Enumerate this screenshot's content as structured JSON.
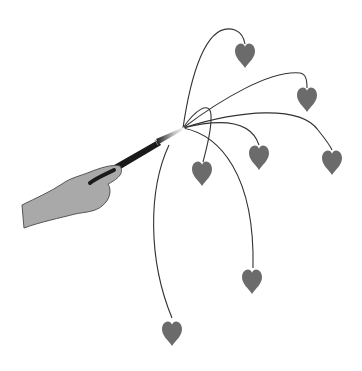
{
  "illustration": {
    "subject": "hand holding magic wand sprouting hearts on curved stems",
    "colors": {
      "background": "#ffffff",
      "hand_fill": "#a9a9a9",
      "hand_stroke": "#555555",
      "wand": "#1a1a1a",
      "wand_tip": "#e8e8e8",
      "stem": "#333333",
      "heart": "#6b6b6b"
    },
    "origin": {
      "x": 184,
      "y": 128
    },
    "hearts": [
      {
        "name": "heart-top",
        "x": 245,
        "y": 55
      },
      {
        "name": "heart-upper-right",
        "x": 307,
        "y": 97
      },
      {
        "name": "heart-right",
        "x": 332,
        "y": 160
      },
      {
        "name": "heart-middle",
        "x": 259,
        "y": 155
      },
      {
        "name": "heart-left",
        "x": 202,
        "y": 172
      },
      {
        "name": "heart-lower",
        "x": 252,
        "y": 280
      },
      {
        "name": "heart-bottom",
        "x": 172,
        "y": 333
      }
    ]
  }
}
